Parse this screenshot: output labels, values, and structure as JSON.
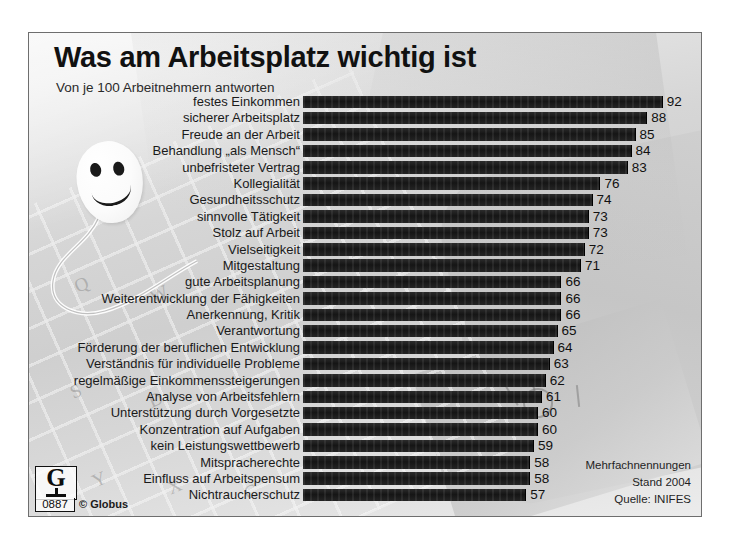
{
  "header": {
    "title": "Was am Arbeitsplatz wichtig ist",
    "subtitle": "Von je 100 Arbeitnehmern antworten"
  },
  "notes": {
    "line1": "Mehrfachnennungen",
    "line2": "Stand 2004",
    "line3": "Quelle: INIFES"
  },
  "logo": {
    "letter": "G",
    "number": "0887",
    "credit": "© Globus"
  },
  "chart_data": {
    "type": "bar",
    "orientation": "horizontal",
    "title": "Was am Arbeitsplatz wichtig ist",
    "subtitle": "Von je 100 Arbeitnehmern antworten",
    "xlabel": "",
    "ylabel": "",
    "xlim": [
      0,
      100
    ],
    "grid": false,
    "legend": false,
    "unit": "von je 100 Arbeitnehmern",
    "source": "INIFES",
    "year": "2004",
    "note": "Mehrfachnennungen",
    "categories": [
      "festes Einkommen",
      "sicherer Arbeitsplatz",
      "Freude an der Arbeit",
      "Behandlung „als Mensch“",
      "unbefristeter Vertrag",
      "Kollegialität",
      "Gesundheitsschutz",
      "sinnvolle Tätigkeit",
      "Stolz auf Arbeit",
      "Vielseitigkeit",
      "Mitgestaltung",
      "gute Arbeitsplanung",
      "Weiterentwicklung der Fähigkeiten",
      "Anerkennung, Kritik",
      "Verantwortung",
      "Förderung der beruflichen Entwicklung",
      "Verständnis für individuelle Probleme",
      "regelmäßige Einkommenssteigerungen",
      "Analyse von Arbeitsfehlern",
      "Unterstützung durch Vorgesetzte",
      "Konzentration auf Aufgaben",
      "kein Leistungswettbewerb",
      "Mitspracherechte",
      "Einfluss auf Arbeitspensum",
      "Nichtraucherschutz"
    ],
    "values": [
      92,
      88,
      85,
      84,
      83,
      76,
      74,
      73,
      73,
      72,
      71,
      66,
      66,
      66,
      65,
      64,
      63,
      62,
      61,
      60,
      60,
      59,
      58,
      58,
      57
    ]
  },
  "colors": {
    "bar": "#1a1a1a",
    "text": "#111111",
    "background": "#d9d9d9",
    "frame_border": "#6e6e6e"
  }
}
